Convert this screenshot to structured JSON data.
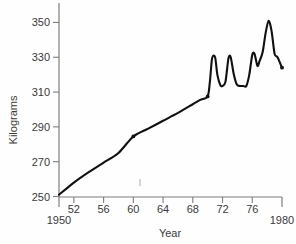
{
  "chart_data": {
    "type": "line",
    "title": "",
    "xlabel": "Year",
    "ylabel": "Kilograms",
    "xlim": [
      1950,
      1980
    ],
    "ylim": [
      250,
      356
    ],
    "grid": false,
    "legend": null,
    "x_tick_labels": [
      "1950",
      "52",
      "56",
      "60",
      "64",
      "68",
      "72",
      "76",
      "1980"
    ],
    "x_tick_values": [
      1950,
      1952,
      1956,
      1960,
      1964,
      1968,
      1972,
      1976,
      1980
    ],
    "y_tick_labels": [
      "250",
      "270",
      "290",
      "310",
      "330",
      "350"
    ],
    "y_tick_values": [
      250,
      270,
      290,
      310,
      330,
      350
    ],
    "series": [
      {
        "name": "Kilograms per year",
        "x": [
          1950.0,
          1952.0,
          1954.0,
          1956.0,
          1958.0,
          1960.0,
          1962.0,
          1964.0,
          1966.0,
          1968.0,
          1969.0,
          1970.0,
          1970.3,
          1970.6,
          1971.0,
          1971.3,
          1971.7,
          1972.0,
          1972.4,
          1972.8,
          1973.1,
          1973.5,
          1973.9,
          1974.3,
          1974.8,
          1975.2,
          1975.6,
          1976.0,
          1976.3,
          1976.7,
          1977.0,
          1977.4,
          1977.8,
          1978.2,
          1978.6,
          1979.0,
          1979.4,
          1980.0
        ],
        "y": [
          251.0,
          258.0,
          264.0,
          269.5,
          275.0,
          284.5,
          289.0,
          293.5,
          298.0,
          303.0,
          305.5,
          307.5,
          316.0,
          329.5,
          330.0,
          320.0,
          314.0,
          313.5,
          316.0,
          329.5,
          330.0,
          320.5,
          314.5,
          313.5,
          313.5,
          313.5,
          320.0,
          331.5,
          332.0,
          325.0,
          328.0,
          333.0,
          344.0,
          351.0,
          345.0,
          332.0,
          330.0,
          324.0
        ]
      }
    ],
    "markers": [
      {
        "x": 1960.0,
        "y": 284.5
      },
      {
        "x": 1970.0,
        "y": 307.5
      },
      {
        "x": 1980.0,
        "y": 324.0
      }
    ],
    "annotations": []
  },
  "colors": {
    "background": "#fefefe",
    "line": "#111111",
    "axis": "#7d7d7d",
    "text": "#3a3a3a"
  }
}
